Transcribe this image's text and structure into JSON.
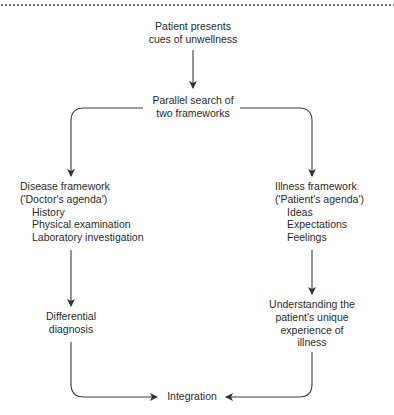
{
  "diagram": {
    "start": {
      "lines": [
        "Patient presents",
        "cues of unwellness"
      ]
    },
    "parallel": {
      "lines": [
        "Parallel search of",
        "two frameworks"
      ]
    },
    "disease_framework": {
      "title_lines": [
        "Disease framework",
        "('Doctor's agenda')"
      ],
      "items": [
        "History",
        "Physical examination",
        "Laboratory investigation"
      ]
    },
    "illness_framework": {
      "title_lines": [
        "Illness framework",
        "('Patient's agenda')"
      ],
      "items": [
        "Ideas",
        "Expectations",
        "Feelings"
      ]
    },
    "differential": {
      "lines": [
        "Differential",
        "diagnosis"
      ]
    },
    "understanding": {
      "lines": [
        "Understanding the",
        "patient's unique",
        "experience of",
        "illness"
      ]
    },
    "integration": {
      "label": "Integration"
    },
    "edges": [
      {
        "from": "start",
        "to": "parallel"
      },
      {
        "from": "parallel",
        "to": "disease_framework"
      },
      {
        "from": "parallel",
        "to": "illness_framework"
      },
      {
        "from": "disease_framework",
        "to": "differential"
      },
      {
        "from": "illness_framework",
        "to": "understanding"
      },
      {
        "from": "differential",
        "to": "integration"
      },
      {
        "from": "understanding",
        "to": "integration"
      }
    ],
    "colors": {
      "line": "#3a3a3a",
      "text": "#2b2b2b",
      "dotted_rule": "#6f6f6f"
    }
  }
}
